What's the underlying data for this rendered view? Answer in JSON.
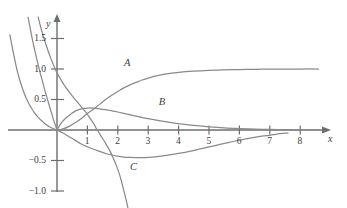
{
  "figure": {
    "title": "",
    "caption": "",
    "background": "#ffffff",
    "curve_color": "#8a8a8a",
    "axis_color": "#6e6e6e",
    "text_color": "#3c3c3c"
  },
  "axes": {
    "x_name": "x",
    "y_name": "y",
    "x_ticks": [
      "1",
      "2",
      "3",
      "4",
      "5",
      "6",
      "7",
      "8"
    ],
    "y_ticks": [
      "1.5",
      "1.0",
      "0.5",
      "−0.5",
      "−1.0"
    ]
  },
  "curve_labels": {
    "a": "A",
    "b": "B",
    "c": "C"
  },
  "chart_data": {
    "type": "line",
    "title": "",
    "xlabel": "x",
    "ylabel": "y",
    "xlim": [
      -1.6,
      8.8
    ],
    "ylim": [
      -1.25,
      1.85
    ],
    "grid": false,
    "legend": "inline-curve-labels",
    "x_ticks": [
      1,
      2,
      3,
      4,
      5,
      6,
      7,
      8
    ],
    "y_ticks": [
      1.5,
      1.0,
      0.5,
      -0.5,
      -1.0
    ],
    "series": [
      {
        "name": "A",
        "label": "A",
        "label_at": [
          2.2,
          1.08
        ],
        "description": "Increasing curve from origin rising to a horizontal asymptote at y = 1",
        "points": [
          [
            0,
            0
          ],
          [
            0.2,
            0.02
          ],
          [
            0.4,
            0.06
          ],
          [
            0.6,
            0.12
          ],
          [
            0.8,
            0.19
          ],
          [
            1.0,
            0.27
          ],
          [
            1.2,
            0.34
          ],
          [
            1.4,
            0.42
          ],
          [
            1.6,
            0.5
          ],
          [
            1.8,
            0.57
          ],
          [
            2.0,
            0.63
          ],
          [
            2.2,
            0.69
          ],
          [
            2.4,
            0.74
          ],
          [
            2.6,
            0.78
          ],
          [
            2.8,
            0.82
          ],
          [
            3.0,
            0.85
          ],
          [
            3.3,
            0.89
          ],
          [
            3.6,
            0.92
          ],
          [
            4.0,
            0.945
          ],
          [
            4.5,
            0.965
          ],
          [
            5.0,
            0.978
          ],
          [
            5.5,
            0.986
          ],
          [
            6.0,
            0.991
          ],
          [
            6.5,
            0.995
          ],
          [
            7.0,
            0.997
          ],
          [
            7.5,
            0.999
          ],
          [
            8.0,
            1.0
          ],
          [
            8.6,
            1.0
          ]
        ]
      },
      {
        "name": "B",
        "label": "B",
        "label_at": [
          3.35,
          0.45
        ],
        "description": "Rises from origin to a maximum near x = 1 then decays toward zero",
        "points": [
          [
            0,
            0
          ],
          [
            0.15,
            0.12
          ],
          [
            0.3,
            0.2
          ],
          [
            0.45,
            0.26
          ],
          [
            0.6,
            0.31
          ],
          [
            0.8,
            0.345
          ],
          [
            1.0,
            0.36
          ],
          [
            1.2,
            0.358
          ],
          [
            1.4,
            0.348
          ],
          [
            1.6,
            0.333
          ],
          [
            1.8,
            0.315
          ],
          [
            2.0,
            0.295
          ],
          [
            2.3,
            0.262
          ],
          [
            2.6,
            0.228
          ],
          [
            3.0,
            0.186
          ],
          [
            3.4,
            0.15
          ],
          [
            3.8,
            0.118
          ],
          [
            4.2,
            0.092
          ],
          [
            4.6,
            0.07
          ],
          [
            5.0,
            0.053
          ],
          [
            5.5,
            0.036
          ],
          [
            6.0,
            0.024
          ],
          [
            6.5,
            0.015
          ],
          [
            7.0,
            0.009
          ],
          [
            7.5,
            0.005
          ],
          [
            8.0,
            0.003
          ],
          [
            8.6,
            0.002
          ]
        ]
      },
      {
        "name": "C",
        "label": "C",
        "label_at": [
          2.4,
          -0.62
        ],
        "description": "Descends from origin to a minimum near x = 2.8 then rises back toward zero",
        "points": [
          [
            0,
            0
          ],
          [
            0.2,
            -0.05
          ],
          [
            0.4,
            -0.11
          ],
          [
            0.6,
            -0.17
          ],
          [
            0.8,
            -0.23
          ],
          [
            1.0,
            -0.275
          ],
          [
            1.2,
            -0.315
          ],
          [
            1.4,
            -0.35
          ],
          [
            1.6,
            -0.385
          ],
          [
            1.8,
            -0.41
          ],
          [
            2.0,
            -0.43
          ],
          [
            2.2,
            -0.443
          ],
          [
            2.4,
            -0.45
          ],
          [
            2.6,
            -0.453
          ],
          [
            2.8,
            -0.452
          ],
          [
            3.0,
            -0.448
          ],
          [
            3.3,
            -0.435
          ],
          [
            3.6,
            -0.415
          ],
          [
            4.0,
            -0.383
          ],
          [
            4.4,
            -0.345
          ],
          [
            4.8,
            -0.3
          ],
          [
            5.2,
            -0.255
          ],
          [
            5.6,
            -0.21
          ],
          [
            6.0,
            -0.168
          ],
          [
            6.4,
            -0.13
          ],
          [
            6.8,
            -0.098
          ],
          [
            7.2,
            -0.07
          ],
          [
            7.6,
            -0.05
          ]
        ]
      },
      {
        "name": "left-branch-outer",
        "label": "",
        "description": "Steeply decaying branch in the second quadrant falling into the origin",
        "points": [
          [
            -1.55,
            1.56
          ],
          [
            -1.45,
            1.3
          ],
          [
            -1.35,
            1.06
          ],
          [
            -1.25,
            0.86
          ],
          [
            -1.15,
            0.7
          ],
          [
            -1.05,
            0.565
          ],
          [
            -0.95,
            0.455
          ],
          [
            -0.85,
            0.365
          ],
          [
            -0.75,
            0.29
          ],
          [
            -0.65,
            0.225
          ],
          [
            -0.55,
            0.172
          ],
          [
            -0.45,
            0.125
          ],
          [
            -0.35,
            0.086
          ],
          [
            -0.25,
            0.053
          ],
          [
            -0.15,
            0.028
          ],
          [
            -0.05,
            0.008
          ],
          [
            0,
            0
          ]
        ]
      },
      {
        "name": "left-branch-inner",
        "label": "",
        "description": "Second steeply decaying branch in the second quadrant falling into the origin",
        "points": [
          [
            -0.95,
            1.85
          ],
          [
            -0.88,
            1.66
          ],
          [
            -0.8,
            1.46
          ],
          [
            -0.72,
            1.28
          ],
          [
            -0.64,
            1.11
          ],
          [
            -0.56,
            0.95
          ],
          [
            -0.48,
            0.8
          ],
          [
            -0.4,
            0.65
          ],
          [
            -0.33,
            0.53
          ],
          [
            -0.26,
            0.41
          ],
          [
            -0.2,
            0.31
          ],
          [
            -0.14,
            0.21
          ],
          [
            -0.09,
            0.13
          ],
          [
            -0.04,
            0.06
          ],
          [
            0,
            0
          ]
        ]
      },
      {
        "name": "right-branch-descending",
        "label": "",
        "description": "Steeply descending curve crossing the axis near x = 1.2 and continuing below",
        "points": [
          [
            -0.62,
            1.85
          ],
          [
            -0.5,
            1.62
          ],
          [
            -0.35,
            1.38
          ],
          [
            -0.2,
            1.17
          ],
          [
            -0.05,
            0.99
          ],
          [
            0.12,
            0.83
          ],
          [
            0.3,
            0.69
          ],
          [
            0.5,
            0.56
          ],
          [
            0.7,
            0.44
          ],
          [
            0.9,
            0.32
          ],
          [
            1.05,
            0.22
          ],
          [
            1.2,
            0.11
          ],
          [
            1.3,
            0.02
          ],
          [
            1.45,
            -0.1
          ],
          [
            1.6,
            -0.22
          ],
          [
            1.75,
            -0.35
          ],
          [
            1.85,
            -0.46
          ],
          [
            1.95,
            -0.58
          ],
          [
            2.05,
            -0.72
          ],
          [
            2.12,
            -0.84
          ],
          [
            2.18,
            -0.96
          ],
          [
            2.24,
            -1.08
          ],
          [
            2.3,
            -1.2
          ],
          [
            2.34,
            -1.3
          ]
        ]
      }
    ]
  }
}
